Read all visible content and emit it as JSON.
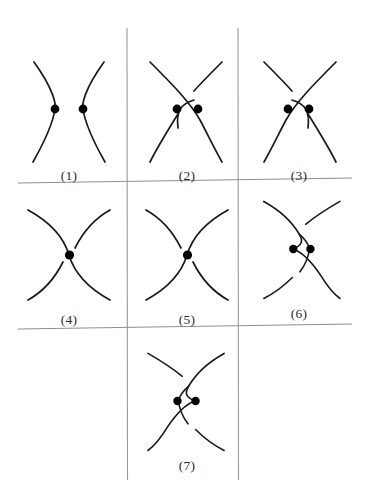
{
  "page": {
    "kind": "figure-plate",
    "background_color": "#ffffff",
    "stroke_color": "#1a1a1a",
    "dot_color": "#000000",
    "rule_color": "#9a9a9a",
    "width": 369,
    "height": 504
  },
  "grid": {
    "vertical_rules": [
      {
        "name": "vertical-rule-left",
        "x": 127,
        "y1": 28,
        "y2": 480
      },
      {
        "name": "vertical-rule-right",
        "x": 238,
        "y1": 28,
        "y2": 480
      }
    ],
    "horizontal_rules": [
      {
        "name": "horizontal-rule-top",
        "y": 181,
        "x1": 18,
        "x2": 352
      },
      {
        "name": "horizontal-rule-bottom",
        "y": 327,
        "x1": 18,
        "x2": 352
      }
    ]
  },
  "figures": [
    {
      "id": 1,
      "label": "(1)",
      "description": "two disjoint arcs bowing apart, one marked point on each arc",
      "crossings": 0,
      "marked_points": 2
    },
    {
      "id": 2,
      "label": "(2)",
      "description": "single crossing with a bigon arc on the left, two marked points",
      "crossings": 1,
      "marked_points": 2
    },
    {
      "id": 3,
      "label": "(3)",
      "description": "mirror of figure 2, bigon arc on the right, two marked points",
      "crossings": 1,
      "marked_points": 2
    },
    {
      "id": 4,
      "label": "(4)",
      "description": "single crossing, one marked point, NE-SW strand broken",
      "crossings": 1,
      "marked_points": 1
    },
    {
      "id": 5,
      "label": "(5)",
      "description": "single crossing, one marked point, NW-SE strand broken",
      "crossings": 1,
      "marked_points": 1
    },
    {
      "id": 6,
      "label": "(6)",
      "description": "two crossings bounding a lens region, two marked points",
      "crossings": 2,
      "marked_points": 2
    },
    {
      "id": 7,
      "label": "(7)",
      "description": "mirror of figure 6, two crossings bounding a lens region, two marked points",
      "crossings": 2,
      "marked_points": 2
    }
  ]
}
